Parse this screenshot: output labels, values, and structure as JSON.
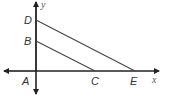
{
  "diagram": {
    "type": "coordinate-geometry",
    "axes": {
      "x_label": "x",
      "y_label": "y",
      "color": "#222222"
    },
    "points": {
      "A": {
        "label": "A",
        "role": "origin"
      },
      "B": {
        "label": "B",
        "on": "y-axis"
      },
      "C": {
        "label": "C",
        "on": "x-axis"
      },
      "D": {
        "label": "D",
        "on": "y-axis"
      },
      "E": {
        "label": "E",
        "on": "x-axis"
      }
    },
    "segments": [
      {
        "from": "D",
        "to": "E"
      },
      {
        "from": "B",
        "to": "C"
      }
    ],
    "line_color": "#444444"
  }
}
